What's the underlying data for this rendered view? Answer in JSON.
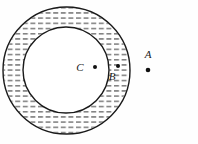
{
  "figure": {
    "background_color": "#fefefe",
    "stroke_color": "#1a1a1a",
    "hatch_color": "#4a4a4a",
    "canvas": {
      "width": 198,
      "height": 144
    }
  },
  "shapes": {
    "outer_circle": {
      "name": "outer-circle",
      "cx": 66.5,
      "cy": 70.5,
      "r": 63.5,
      "stroke_width": 1.4,
      "fill": "none"
    },
    "inner_circle": {
      "name": "inner-circle",
      "cx": 66.0,
      "cy": 70.0,
      "r": 43.0,
      "stroke_width": 1.4,
      "fill": "#ffffff"
    },
    "annulus": {
      "name": "shaded-annulus",
      "pattern": "horizontal-dashes",
      "dash_length": 5,
      "dash_gap": 2.6,
      "row_spacing": 5.2,
      "dash_thickness": 1.1
    }
  },
  "points": [
    {
      "id": "C",
      "label": "C",
      "dot_x": 95.0,
      "dot_y": 67.0,
      "dot_r": 2.0,
      "label_x": 80.0,
      "label_y": 71.0,
      "region": "inside-inner-circle"
    },
    {
      "id": "B",
      "label": "B",
      "dot_x": 118.0,
      "dot_y": 66.0,
      "dot_r": 2.0,
      "label_x": 112.0,
      "label_y": 80.0,
      "region": "inside-annulus"
    },
    {
      "id": "A",
      "label": "A",
      "dot_x": 148.0,
      "dot_y": 70.0,
      "dot_r": 2.3,
      "label_x": 144.0,
      "label_y": 58.0,
      "region": "outside-outer-circle"
    }
  ]
}
